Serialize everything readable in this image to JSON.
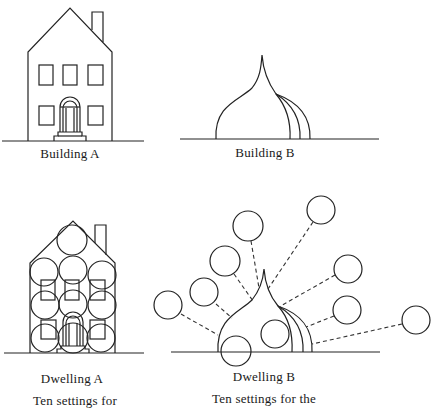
{
  "figure": {
    "panels": [
      {
        "id": "building-a",
        "label": "Building A"
      },
      {
        "id": "building-b",
        "label": "Building B"
      },
      {
        "id": "dwelling-a",
        "label": "Dwelling A",
        "caption": "Ten settings for"
      },
      {
        "id": "dwelling-b",
        "label": "Dwelling B",
        "caption": "Ten settings for the"
      }
    ],
    "settings_count": 10
  }
}
